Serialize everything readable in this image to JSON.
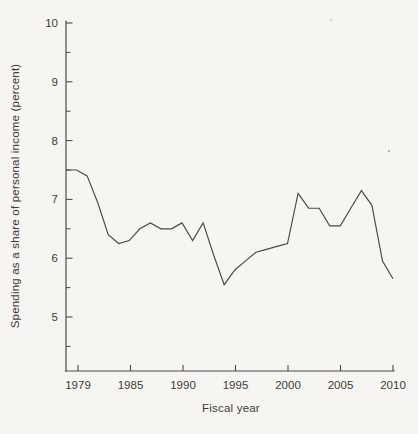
{
  "figure": {
    "kind": "scanned-book-line-chart",
    "background_color": "#f6f5f1",
    "ink_color": "#4a4945"
  },
  "chart_data": {
    "type": "line",
    "title": "",
    "xlabel": "Fiscal year",
    "ylabel": "Spending as a share of personal income (percent)",
    "x": [
      1979,
      1980,
      1981,
      1982,
      1983,
      1984,
      1985,
      1986,
      1987,
      1988,
      1989,
      1990,
      1991,
      1992,
      1993,
      1994,
      1995,
      1996,
      1997,
      1998,
      1999,
      2000,
      2001,
      2002,
      2003,
      2004,
      2005,
      2006,
      2007,
      2008,
      2009,
      2010
    ],
    "values": [
      7.5,
      7.5,
      7.4,
      6.95,
      6.4,
      6.25,
      6.3,
      6.5,
      6.6,
      6.5,
      6.5,
      6.6,
      6.3,
      6.6,
      6.05,
      5.55,
      5.8,
      5.95,
      6.1,
      6.15,
      6.2,
      6.25,
      7.1,
      6.85,
      6.85,
      6.55,
      6.55,
      6.85,
      7.15,
      6.9,
      5.95,
      5.65
    ],
    "x_tick_labels": [
      "1979",
      "1985",
      "1990",
      "1995",
      "2000",
      "2005",
      "2010"
    ],
    "y_tick_labels": [
      "5",
      "6",
      "7",
      "8",
      "9",
      "10"
    ],
    "y_ticks": [
      5,
      6,
      7,
      8,
      9,
      10
    ],
    "y_minor_ticks": [
      4.5,
      5.5,
      6.5,
      7.5,
      8.5,
      9.5
    ],
    "xlim": [
      1979,
      2010
    ],
    "ylim": [
      4.05,
      10
    ],
    "grid": false,
    "legend": null
  }
}
